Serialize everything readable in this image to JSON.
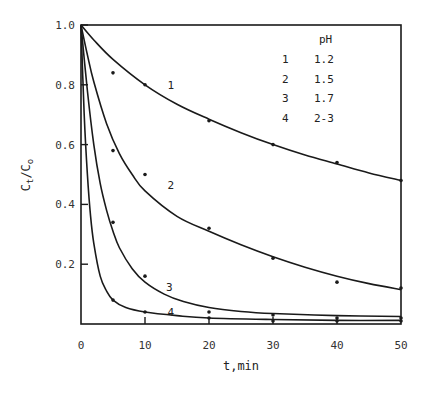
{
  "chart_data": {
    "type": "line",
    "title": "",
    "xlabel": "t,min",
    "ylabel": "Ct/Co",
    "ylabel_parts": {
      "main1": "C",
      "sub1": "t",
      "slash": "/",
      "main2": "C",
      "sub2": "o"
    },
    "xlim": [
      0,
      50
    ],
    "ylim": [
      0,
      1.0
    ],
    "x_ticks": [
      "0",
      "10",
      "20",
      "30",
      "40",
      "50"
    ],
    "y_ticks": [
      "1.0",
      "0.8",
      "0.6",
      "0.4",
      "0.2"
    ],
    "grid": false,
    "legend": {
      "position": "upper right (inside)",
      "header": "pH",
      "entries": [
        {
          "id": "1",
          "value": "1.2"
        },
        {
          "id": "2",
          "value": "1.5"
        },
        {
          "id": "3",
          "value": "1.7"
        },
        {
          "id": "4",
          "value": "2-3"
        }
      ]
    },
    "series": [
      {
        "name": "1",
        "ph": "1.2",
        "points": [
          [
            5,
            0.84
          ],
          [
            10,
            0.8
          ],
          [
            20,
            0.68
          ],
          [
            30,
            0.6
          ],
          [
            40,
            0.54
          ],
          [
            50,
            0.48
          ]
        ],
        "curve": [
          [
            0,
            1.0
          ],
          [
            2,
            0.95
          ],
          [
            5,
            0.885
          ],
          [
            10,
            0.8
          ],
          [
            15,
            0.735
          ],
          [
            20,
            0.685
          ],
          [
            25,
            0.64
          ],
          [
            30,
            0.6
          ],
          [
            35,
            0.565
          ],
          [
            40,
            0.535
          ],
          [
            45,
            0.505
          ],
          [
            50,
            0.48
          ]
        ],
        "label_pos": [
          13.5,
          0.8
        ]
      },
      {
        "name": "2",
        "ph": "1.5",
        "points": [
          [
            5,
            0.58
          ],
          [
            10,
            0.5
          ],
          [
            20,
            0.32
          ],
          [
            30,
            0.22
          ],
          [
            40,
            0.14
          ],
          [
            50,
            0.12
          ]
        ],
        "curve": [
          [
            0,
            1.0
          ],
          [
            1,
            0.9
          ],
          [
            2,
            0.81
          ],
          [
            4,
            0.67
          ],
          [
            6,
            0.57
          ],
          [
            8,
            0.5
          ],
          [
            10,
            0.445
          ],
          [
            15,
            0.36
          ],
          [
            20,
            0.31
          ],
          [
            25,
            0.265
          ],
          [
            30,
            0.225
          ],
          [
            35,
            0.19
          ],
          [
            40,
            0.16
          ],
          [
            45,
            0.135
          ],
          [
            50,
            0.115
          ]
        ],
        "label_pos": [
          13.5,
          0.465
        ]
      },
      {
        "name": "3",
        "ph": "1.7",
        "points": [
          [
            5,
            0.34
          ],
          [
            10,
            0.16
          ],
          [
            20,
            0.04
          ],
          [
            30,
            0.03
          ],
          [
            40,
            0.02
          ],
          [
            50,
            0.02
          ]
        ],
        "curve": [
          [
            0,
            1.0
          ],
          [
            1,
            0.78
          ],
          [
            2,
            0.6
          ],
          [
            3,
            0.47
          ],
          [
            4,
            0.38
          ],
          [
            5,
            0.31
          ],
          [
            6,
            0.255
          ],
          [
            8,
            0.185
          ],
          [
            10,
            0.14
          ],
          [
            13,
            0.1
          ],
          [
            16,
            0.075
          ],
          [
            20,
            0.055
          ],
          [
            25,
            0.042
          ],
          [
            30,
            0.035
          ],
          [
            40,
            0.028
          ],
          [
            50,
            0.025
          ]
        ],
        "label_pos": [
          13.3,
          0.125
        ]
      },
      {
        "name": "4",
        "ph": "2-3",
        "points": [
          [
            5,
            0.08
          ],
          [
            10,
            0.04
          ],
          [
            20,
            0.02
          ],
          [
            30,
            0.01
          ],
          [
            40,
            0.01
          ],
          [
            50,
            0.01
          ]
        ],
        "curve": [
          [
            0,
            1.0
          ],
          [
            0.5,
            0.7
          ],
          [
            1,
            0.5
          ],
          [
            1.5,
            0.36
          ],
          [
            2,
            0.27
          ],
          [
            3,
            0.16
          ],
          [
            4,
            0.11
          ],
          [
            5,
            0.08
          ],
          [
            7,
            0.055
          ],
          [
            10,
            0.04
          ],
          [
            15,
            0.028
          ],
          [
            20,
            0.02
          ],
          [
            30,
            0.015
          ],
          [
            40,
            0.012
          ],
          [
            50,
            0.012
          ]
        ],
        "label_pos": [
          13.5,
          0.04
        ]
      }
    ]
  }
}
